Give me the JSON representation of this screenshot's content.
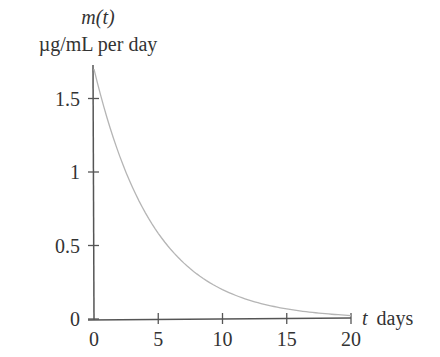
{
  "chart_data": {
    "type": "line",
    "title": "",
    "ylabel_line1": "m(t)",
    "ylabel_line2": "µg/mL per day",
    "xlabel_var": "t",
    "xlabel_unit": "days",
    "xlim": [
      0,
      20
    ],
    "ylim": [
      0,
      1.7
    ],
    "x_ticks": [
      0,
      5,
      10,
      15,
      20
    ],
    "x_tick_labels": [
      "0",
      "5",
      "10",
      "15",
      "20"
    ],
    "y_ticks": [
      0,
      0.5,
      1,
      1.5
    ],
    "y_tick_labels": [
      "0",
      "0.5",
      "1",
      "1.5"
    ],
    "grid": false,
    "legend": null,
    "series": [
      {
        "name": "m(t)",
        "formula": "1.7*exp(-0.214*t)",
        "color": "#b5b5b5",
        "x": [
          0,
          1,
          2,
          3,
          4,
          5,
          6,
          7,
          8,
          9,
          10,
          11,
          12,
          13,
          14,
          15,
          16,
          17,
          18,
          19,
          20
        ],
        "values": [
          1.7,
          1.37,
          1.11,
          0.9,
          0.72,
          0.58,
          0.47,
          0.38,
          0.31,
          0.25,
          0.2,
          0.16,
          0.13,
          0.1,
          0.085,
          0.068,
          0.055,
          0.045,
          0.036,
          0.029,
          0.024
        ]
      }
    ]
  },
  "colors": {
    "axis": "#555555",
    "curve": "#b5b5b5",
    "text": "#333333"
  }
}
